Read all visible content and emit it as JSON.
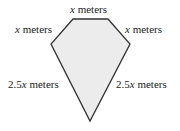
{
  "figure": {
    "shape": "kite-pentagon",
    "fill_color": "#ececec",
    "stroke_color": "#333333",
    "vertices": [
      [
        73,
        19
      ],
      [
        108,
        19
      ],
      [
        130,
        44
      ],
      [
        90,
        121
      ],
      [
        51,
        44
      ]
    ],
    "labels": {
      "top": {
        "var": "x",
        "unit": " meters"
      },
      "upper_left": {
        "var": "x",
        "unit": " meters"
      },
      "upper_right": {
        "var": "x",
        "unit": " meters"
      },
      "lower_left": {
        "coef": "2.5",
        "var": "x",
        "unit": " meters"
      },
      "lower_right": {
        "coef": "2.5",
        "var": "x",
        "unit": " meters"
      }
    }
  }
}
